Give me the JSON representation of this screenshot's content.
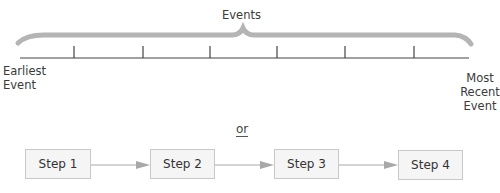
{
  "timeline": {
    "title": "Events",
    "start_label": [
      "Earliest",
      "Event"
    ],
    "end_label": [
      "Most",
      "Recent",
      "Event"
    ],
    "tick_count": 6,
    "brace_color": "#b4b4b4",
    "line_color": "#444444"
  },
  "separator": "or",
  "steps": [
    {
      "label": "Step 1"
    },
    {
      "label": "Step 2"
    },
    {
      "label": "Step 3"
    },
    {
      "label": "Step 4"
    }
  ],
  "colors": {
    "box_fill": "#f5f5f5",
    "box_border": "#c8c8c8",
    "arrow": "#a8a8a8"
  }
}
